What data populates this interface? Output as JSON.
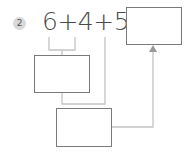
{
  "problem": {
    "number": "2",
    "equation": "6+4+5=",
    "answer_box_value": "",
    "step1_box_value": "",
    "step2_box_value": ""
  },
  "colors": {
    "badge_bg": "#d9d9d9",
    "text": "#4a4a4a",
    "box_border": "#7a7a7a",
    "connector": "#c4c4c4",
    "arrow": "#999999"
  }
}
